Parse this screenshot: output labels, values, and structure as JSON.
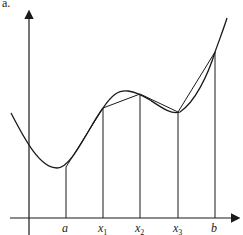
{
  "figure": {
    "panel_label": "a.",
    "x_labels": [
      {
        "id": "a",
        "base": "a",
        "sub": ""
      },
      {
        "id": "x1",
        "base": "x",
        "sub": "1"
      },
      {
        "id": "x2",
        "base": "x",
        "sub": "2"
      },
      {
        "id": "x3",
        "base": "x",
        "sub": "3"
      },
      {
        "id": "b",
        "base": "b",
        "sub": ""
      }
    ],
    "colors": {
      "stroke": "#1a1a1a",
      "background": "#ffffff"
    }
  }
}
